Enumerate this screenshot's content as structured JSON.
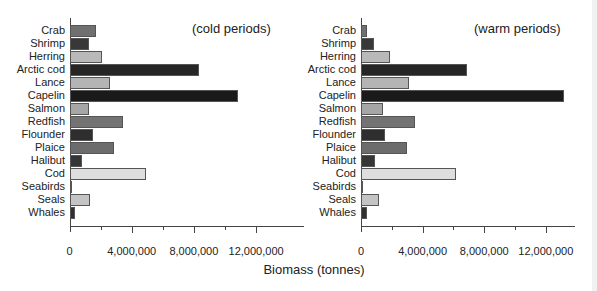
{
  "chart_data": [
    {
      "type": "bar",
      "orientation": "horizontal",
      "title": "(cold periods)",
      "xlabel": "Biomass (tonnes)",
      "ylabel": "",
      "xlim": [
        0,
        14000000
      ],
      "xticks": [
        0,
        4000000,
        8000000,
        12000000
      ],
      "xtick_labels": [
        "0",
        "4,000,000",
        "8,000,000",
        "12,000,000"
      ],
      "grid": false,
      "categories": [
        "Crab",
        "Shrimp",
        "Herring",
        "Arctic cod",
        "Lance",
        "Capelin",
        "Salmon",
        "Redfish",
        "Flounder",
        "Plaice",
        "Halibut",
        "Cod",
        "Seabirds",
        "Seals",
        "Whales"
      ],
      "values": [
        1650000,
        1250000,
        2050000,
        8300000,
        2600000,
        10800000,
        1250000,
        3400000,
        1450000,
        2800000,
        800000,
        4900000,
        100000,
        1300000,
        350000
      ]
    },
    {
      "type": "bar",
      "orientation": "horizontal",
      "title": "(warm periods)",
      "xlabel": "Biomass (tonnes)",
      "ylabel": "",
      "xlim": [
        0,
        14000000
      ],
      "xticks": [
        0,
        4000000,
        8000000,
        12000000
      ],
      "xtick_labels": [
        "0",
        "4,000,000",
        "8,000,000",
        "12,000,000"
      ],
      "grid": false,
      "categories": [
        "Crab",
        "Shrimp",
        "Herring",
        "Arctic cod",
        "Lance",
        "Capelin",
        "Salmon",
        "Redfish",
        "Flounder",
        "Plaice",
        "Halibut",
        "Cod",
        "Seabirds",
        "Seals",
        "Whales"
      ],
      "values": [
        400000,
        850000,
        1900000,
        6900000,
        3100000,
        13200000,
        1400000,
        3500000,
        1550000,
        3000000,
        900000,
        6200000,
        100000,
        1200000,
        400000
      ]
    }
  ],
  "shared_xlabel": "Biomass (tonnes)",
  "colors": {
    "Crab": "#707070",
    "Shrimp": "#383838",
    "Herring": "#b9b9b9",
    "Arctic cod": "#262626",
    "Lance": "#b4b4b4",
    "Capelin": "#1a1a1a",
    "Salmon": "#a6a6a6",
    "Redfish": "#737373",
    "Flounder": "#2e2e2e",
    "Plaice": "#6c6c6c",
    "Halibut": "#363636",
    "Cod": "#dedede",
    "Seabirds": "#666666",
    "Seals": "#c4c4c4",
    "Whales": "#303030"
  }
}
